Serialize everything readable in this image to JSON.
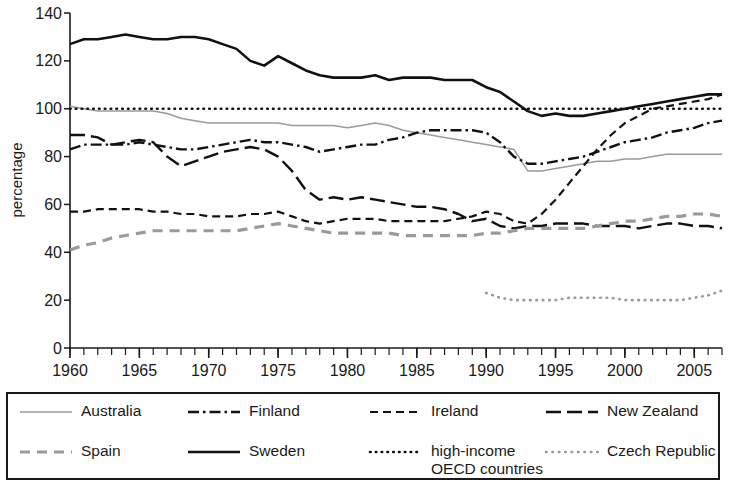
{
  "chart_data": {
    "type": "line",
    "title": "",
    "xlabel": "",
    "ylabel": "percentage",
    "xlim": [
      1960,
      2007
    ],
    "ylim": [
      0,
      140
    ],
    "yticks": [
      0,
      20,
      40,
      60,
      80,
      100,
      120,
      140
    ],
    "xticks_labeled": [
      1960,
      1965,
      1970,
      1975,
      1980,
      1985,
      1990,
      1995,
      2000,
      2005
    ],
    "xtick_step_minor": 1,
    "grid": false,
    "legend_position": "bottom",
    "x": [
      1960,
      1961,
      1962,
      1963,
      1964,
      1965,
      1966,
      1967,
      1968,
      1969,
      1970,
      1971,
      1972,
      1973,
      1974,
      1975,
      1976,
      1977,
      1978,
      1979,
      1980,
      1981,
      1982,
      1983,
      1984,
      1985,
      1986,
      1987,
      1988,
      1989,
      1990,
      1991,
      1992,
      1993,
      1994,
      1995,
      1996,
      1997,
      1998,
      1999,
      2000,
      2001,
      2002,
      2003,
      2004,
      2005,
      2006,
      2007
    ],
    "series": [
      {
        "name": "Australia",
        "style": "solid-thin-gray",
        "color": "#9a9a9a",
        "values": [
          101,
          100,
          99,
          99,
          99,
          99,
          99,
          98,
          96,
          95,
          94,
          94,
          94,
          94,
          94,
          94,
          93,
          93,
          93,
          93,
          92,
          93,
          94,
          93,
          91,
          90,
          89,
          88,
          87,
          86,
          85,
          84,
          83,
          74,
          74,
          75,
          76,
          77,
          78,
          78,
          79,
          79,
          80,
          81,
          81,
          81,
          81,
          81
        ]
      },
      {
        "name": "Finland",
        "style": "dash-dot",
        "color": "#111111",
        "values": [
          83,
          85,
          85,
          85,
          85,
          86,
          85,
          84,
          83,
          83,
          84,
          85,
          86,
          87,
          86,
          86,
          85,
          84,
          82,
          83,
          84,
          85,
          85,
          87,
          88,
          90,
          91,
          91,
          91,
          91,
          90,
          86,
          80,
          77,
          77,
          78,
          79,
          80,
          82,
          84,
          86,
          87,
          88,
          90,
          91,
          92,
          94,
          95
        ]
      },
      {
        "name": "Ireland",
        "style": "dashed-short",
        "color": "#111111",
        "values": [
          57,
          57,
          58,
          58,
          58,
          58,
          57,
          57,
          56,
          56,
          55,
          55,
          55,
          56,
          56,
          57,
          55,
          53,
          52,
          53,
          54,
          54,
          54,
          53,
          53,
          53,
          53,
          53,
          54,
          55,
          57,
          56,
          53,
          52,
          56,
          62,
          69,
          76,
          83,
          89,
          94,
          97,
          100,
          101,
          102,
          103,
          104,
          106
        ]
      },
      {
        "name": "New Zealand",
        "style": "dashed-long",
        "color": "#111111",
        "values": [
          89,
          89,
          88,
          85,
          86,
          87,
          86,
          80,
          76,
          78,
          80,
          82,
          83,
          84,
          83,
          80,
          74,
          66,
          62,
          63,
          62,
          63,
          62,
          61,
          60,
          59,
          59,
          58,
          56,
          53,
          54,
          51,
          50,
          51,
          51,
          52,
          52,
          52,
          51,
          51,
          51,
          50,
          51,
          52,
          52,
          51,
          51,
          50
        ]
      },
      {
        "name": "Spain",
        "style": "dashed-gray-thick",
        "color": "#9a9a9a",
        "values": [
          41,
          43,
          44,
          46,
          47,
          48,
          49,
          49,
          49,
          49,
          49,
          49,
          49,
          50,
          51,
          52,
          51,
          50,
          49,
          48,
          48,
          48,
          48,
          48,
          47,
          47,
          47,
          47,
          47,
          47,
          48,
          48,
          49,
          50,
          50,
          50,
          50,
          50,
          51,
          52,
          53,
          53,
          54,
          55,
          55,
          56,
          56,
          55
        ]
      },
      {
        "name": "Sweden",
        "style": "solid-thick",
        "color": "#111111",
        "values": [
          127,
          129,
          129,
          130,
          131,
          130,
          129,
          129,
          130,
          130,
          129,
          127,
          125,
          120,
          118,
          122,
          119,
          116,
          114,
          113,
          113,
          113,
          114,
          112,
          113,
          113,
          113,
          112,
          112,
          112,
          109,
          107,
          103,
          99,
          97,
          98,
          97,
          97,
          98,
          99,
          100,
          101,
          102,
          103,
          104,
          105,
          106,
          106
        ]
      },
      {
        "name": "high-income\nOECD countries",
        "style": "dotted-black",
        "color": "#111111",
        "values": [
          100,
          100,
          100,
          100,
          100,
          100,
          100,
          100,
          100,
          100,
          100,
          100,
          100,
          100,
          100,
          100,
          100,
          100,
          100,
          100,
          100,
          100,
          100,
          100,
          100,
          100,
          100,
          100,
          100,
          100,
          100,
          100,
          100,
          100,
          100,
          100,
          100,
          100,
          100,
          100,
          100,
          100,
          100,
          100,
          100,
          100,
          100,
          100
        ]
      },
      {
        "name": "Czech Republic",
        "style": "dotted-gray",
        "color": "#9a9a9a",
        "start_year": 1990,
        "values": [
          null,
          null,
          null,
          null,
          null,
          null,
          null,
          null,
          null,
          null,
          null,
          null,
          null,
          null,
          null,
          null,
          null,
          null,
          null,
          null,
          null,
          null,
          null,
          null,
          null,
          null,
          null,
          null,
          null,
          null,
          23,
          21,
          20,
          20,
          20,
          20,
          21,
          21,
          21,
          21,
          20,
          20,
          20,
          20,
          20,
          21,
          22,
          24
        ]
      }
    ]
  },
  "axes": {
    "ylabel": "percentage",
    "yticks": [
      "0",
      "20",
      "40",
      "60",
      "80",
      "100",
      "120",
      "140"
    ],
    "xticks": [
      "1960",
      "1965",
      "1970",
      "1975",
      "1980",
      "1985",
      "1990",
      "1995",
      "2000",
      "2005"
    ]
  },
  "legend": {
    "items": [
      {
        "label": "Australia",
        "swatch": "solid-thin-gray"
      },
      {
        "label": "Finland",
        "swatch": "dash-dot"
      },
      {
        "label": "Ireland",
        "swatch": "dashed-short"
      },
      {
        "label": "New Zealand",
        "swatch": "dashed-long"
      },
      {
        "label": "Spain",
        "swatch": "dashed-gray-thick"
      },
      {
        "label": "Sweden",
        "swatch": "solid-thick"
      },
      {
        "label": "high-income\nOECD countries",
        "swatch": "dotted-black"
      },
      {
        "label": "Czech Republic",
        "swatch": "dotted-gray"
      }
    ]
  },
  "colors": {
    "ink": "#111111",
    "gray": "#9a9a9a",
    "background": "#ffffff"
  }
}
